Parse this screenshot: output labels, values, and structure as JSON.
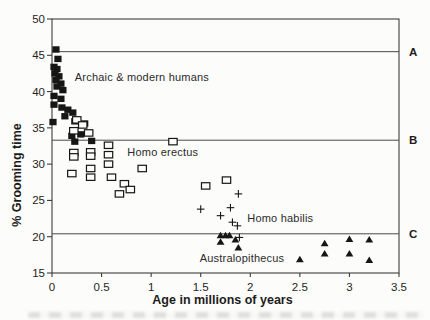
{
  "figure": {
    "background": "#fcfcfa",
    "ink_color": "#161616",
    "frame_color": "#3c3c3c",
    "reference_line_color": "#4a4a4a"
  },
  "chart_data": {
    "type": "scatter",
    "title": "",
    "xlabel": "Age in millions of years",
    "ylabel": "% Grooming time",
    "xlim": [
      0,
      3.5
    ],
    "ylim": [
      15,
      50
    ],
    "xticks": [
      0,
      0.5,
      1,
      1.5,
      2,
      2.5,
      3,
      3.5
    ],
    "yticks": [
      15,
      20,
      25,
      30,
      35,
      40,
      45,
      50
    ],
    "grid": false,
    "frame": true,
    "legend": "in-plot text annotations",
    "reference_lines": [
      {
        "label": "A",
        "y": 45.5
      },
      {
        "label": "B",
        "y": 33.3
      },
      {
        "label": "C",
        "y": 20.4
      }
    ],
    "series": [
      {
        "name": "Archaic & modern humans",
        "marker": "filled-square",
        "label_pos": {
          "x": 0.23,
          "y": 42.0
        },
        "points": [
          [
            0.04,
            45.8
          ],
          [
            0.06,
            44.5
          ],
          [
            0.02,
            43.4
          ],
          [
            0.05,
            43.1
          ],
          [
            0.03,
            42.5
          ],
          [
            0.07,
            42.1
          ],
          [
            0.04,
            41.6
          ],
          [
            0.09,
            41.1
          ],
          [
            0.05,
            40.7
          ],
          [
            0.11,
            40.2
          ],
          [
            0.02,
            39.4
          ],
          [
            0.09,
            39.0
          ],
          [
            0.02,
            38.2
          ],
          [
            0.1,
            37.8
          ],
          [
            0.16,
            37.5
          ],
          [
            0.21,
            37.1
          ],
          [
            0.13,
            36.6
          ],
          [
            0.01,
            35.8
          ],
          [
            0.23,
            35.9
          ],
          [
            0.33,
            35.6
          ],
          [
            0.2,
            33.9
          ],
          [
            0.29,
            34.1
          ],
          [
            0.23,
            33.1
          ],
          [
            0.4,
            33.2
          ]
        ]
      },
      {
        "name": "Homo erectus",
        "marker": "open-square",
        "label_pos": {
          "x": 0.76,
          "y": 31.65
        },
        "points": [
          [
            0.25,
            36.1
          ],
          [
            0.31,
            35.4
          ],
          [
            0.22,
            34.6
          ],
          [
            0.37,
            34.3
          ],
          [
            0.22,
            31.6
          ],
          [
            0.22,
            31.0
          ],
          [
            0.39,
            31.7
          ],
          [
            0.39,
            31.1
          ],
          [
            0.57,
            32.6
          ],
          [
            0.57,
            31.3
          ],
          [
            0.57,
            30.0
          ],
          [
            0.39,
            29.4
          ],
          [
            0.2,
            28.7
          ],
          [
            0.39,
            28.2
          ],
          [
            0.6,
            28.2
          ],
          [
            0.91,
            29.4
          ],
          [
            1.22,
            33.1
          ],
          [
            0.73,
            27.3
          ],
          [
            0.79,
            26.5
          ],
          [
            0.68,
            25.9
          ],
          [
            1.55,
            27.0
          ],
          [
            1.76,
            27.8
          ]
        ]
      },
      {
        "name": "Homo habilis",
        "marker": "plus",
        "label_pos": {
          "x": 1.97,
          "y": 22.55
        },
        "points": [
          [
            1.88,
            25.9
          ],
          [
            1.5,
            23.8
          ],
          [
            1.8,
            24.0
          ],
          [
            1.7,
            22.9
          ],
          [
            1.82,
            22.0
          ],
          [
            1.87,
            21.5
          ],
          [
            1.89,
            19.9
          ]
        ]
      },
      {
        "name": "Australopithecus",
        "marker": "filled-triangle",
        "label_pos": {
          "x": 1.49,
          "y": 17.05
        },
        "points": [
          [
            1.7,
            20.2
          ],
          [
            1.75,
            20.2
          ],
          [
            1.79,
            20.2
          ],
          [
            1.7,
            19.3
          ],
          [
            1.85,
            19.6
          ],
          [
            1.88,
            18.5
          ],
          [
            2.5,
            16.9
          ],
          [
            2.75,
            19.1
          ],
          [
            2.75,
            17.7
          ],
          [
            3.0,
            19.7
          ],
          [
            3.0,
            17.7
          ],
          [
            3.2,
            19.6
          ],
          [
            3.2,
            16.8
          ]
        ]
      }
    ]
  }
}
